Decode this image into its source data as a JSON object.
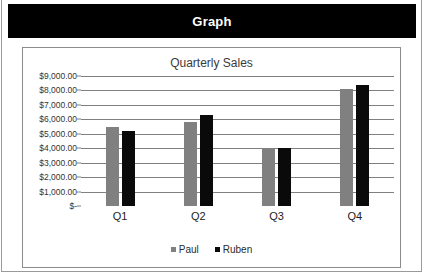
{
  "header": {
    "title": "Graph"
  },
  "chart_data": {
    "type": "bar",
    "title": "Quarterly Sales",
    "xlabel": "",
    "ylabel": "",
    "categories": [
      "Q1",
      "Q2",
      "Q3",
      "Q4"
    ],
    "series": [
      {
        "name": "Paul",
        "color": "#808080",
        "values": [
          5500,
          5800,
          4000,
          8100
        ]
      },
      {
        "name": "Ruben",
        "color": "#0a0a0a",
        "values": [
          5200,
          6300,
          4000,
          8400
        ]
      }
    ],
    "ylim": [
      0,
      9000
    ],
    "ytick_values": [
      0,
      1000,
      2000,
      3000,
      4000,
      5000,
      6000,
      7000,
      8000,
      9000
    ],
    "ytick_labels": [
      "$-",
      "$1,000.00",
      "$2,000.00",
      "$3,000.00",
      "$4,000.00",
      "$5,000.00",
      "$6,000.00",
      "$7,000.00",
      "$8,000.00",
      "$9,000.00"
    ],
    "grid": true,
    "legend_position": "bottom"
  }
}
